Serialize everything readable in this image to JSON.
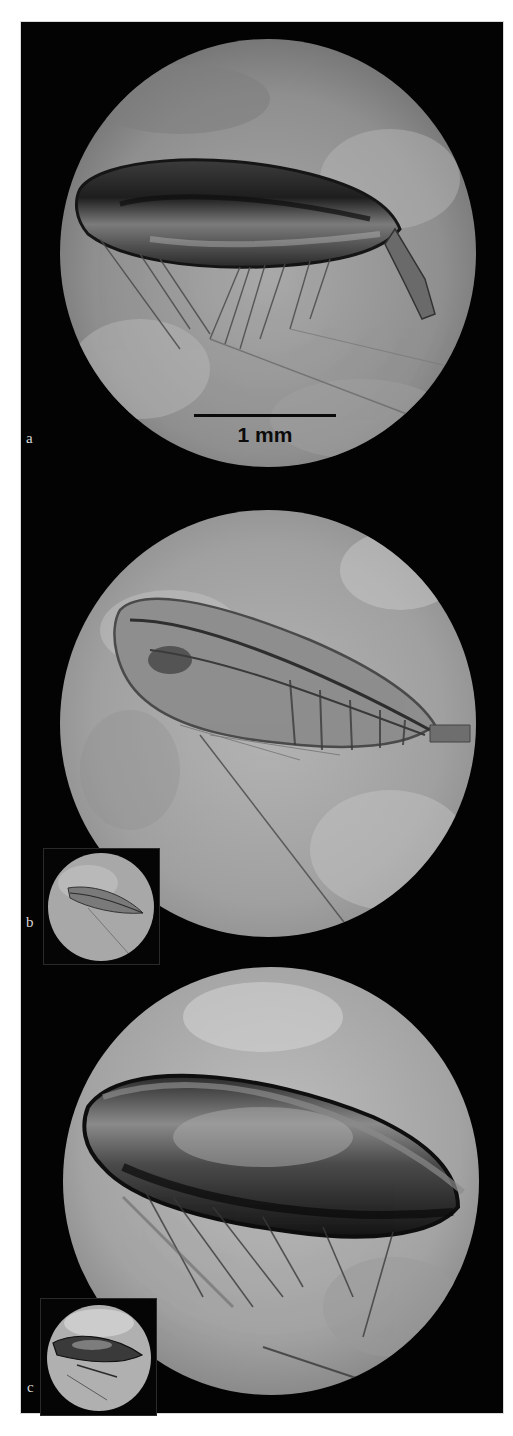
{
  "figure": {
    "background_color": "#030303",
    "panels": [
      {
        "id": "a",
        "label": "a",
        "scale_bar": {
          "label": "1 mm",
          "length_px": 142
        },
        "has_inset": false
      },
      {
        "id": "b",
        "label": "b",
        "has_inset": true
      },
      {
        "id": "c",
        "label": "c",
        "has_inset": true
      }
    ]
  }
}
